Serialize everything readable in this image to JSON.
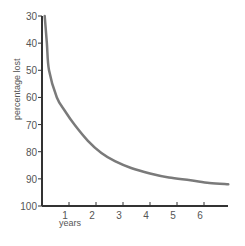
{
  "chart_data": {
    "type": "line",
    "title": "",
    "xlabel": "years",
    "ylabel": "percentage lost",
    "xlim": [
      0,
      7
    ],
    "ylim": [
      30,
      100
    ],
    "y_inverted": true,
    "grid": false,
    "legend": null,
    "x_ticks": [
      "1",
      "2",
      "3",
      "4",
      "5",
      "6"
    ],
    "y_ticks": [
      "30",
      "40",
      "50",
      "60",
      "70",
      "80",
      "90",
      "100"
    ],
    "series": [
      {
        "name": "percentage lost",
        "color": "#7a7a7a",
        "x": [
          0.1,
          0.18,
          0.26,
          0.55,
          0.85,
          1.2,
          1.7,
          2.2,
          2.7,
          3.3,
          4.0,
          4.7,
          5.5,
          6.2,
          6.9
        ],
        "values": [
          30,
          40,
          50,
          60,
          65,
          70,
          76,
          80.5,
          83.5,
          86,
          88,
          89.5,
          90.5,
          91.5,
          92
        ]
      }
    ]
  },
  "axes": {
    "axis_color": "#333333",
    "xlabel": "years",
    "ylabel": "percentage lost"
  }
}
